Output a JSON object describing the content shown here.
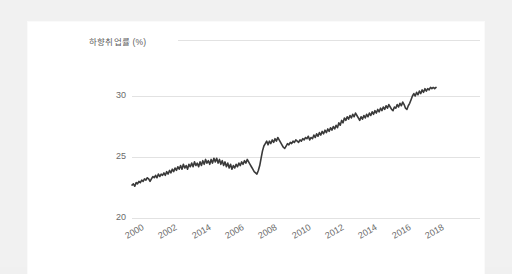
{
  "page": {
    "background_color": "#f1f1f1",
    "card_color": "#ffffff"
  },
  "chart_data": {
    "type": "line",
    "title": "",
    "subtitle": "",
    "xlabel": "",
    "ylabel": "하향취업률 (%)",
    "ylabel_position": "top-left",
    "grid": "horizontal",
    "legend": "none",
    "line_color": "#3a3a3a",
    "line_width": 1.6,
    "axis_tick_color": "#6a6a6a",
    "gridline_color": "#e2e2e2",
    "ylim": [
      20,
      31.5
    ],
    "yticks": [
      20,
      25,
      30
    ],
    "ytick_labels": [
      "20",
      "25",
      "30"
    ],
    "xlim": [
      2000,
      2019.2
    ],
    "xtick_values": [
      2000,
      2002,
      2004,
      2006,
      2008,
      2010,
      2012,
      2014,
      2016,
      2018
    ],
    "xtick_labels": [
      "2000",
      "2002",
      "2014",
      "2006",
      "2008",
      "2010",
      "2012",
      "2014",
      "2016",
      "2018"
    ],
    "xtick_note": "third tick label is printed as 2014 in the source image though its position corresponds to 2004",
    "series": [
      {
        "name": "하향취업률",
        "x_start": 2000.0,
        "x_step": 0.0833,
        "values": [
          22.7,
          22.8,
          22.6,
          22.9,
          22.8,
          23.0,
          22.9,
          23.1,
          23.0,
          23.2,
          23.1,
          23.3,
          23.2,
          23.0,
          23.2,
          23.4,
          23.3,
          23.5,
          23.3,
          23.6,
          23.4,
          23.6,
          23.5,
          23.7,
          23.5,
          23.8,
          23.6,
          23.9,
          23.7,
          24.0,
          23.8,
          24.1,
          23.9,
          24.2,
          24.0,
          24.3,
          24.0,
          24.4,
          24.1,
          24.3,
          24.0,
          24.4,
          24.2,
          24.5,
          24.2,
          24.6,
          24.3,
          24.5,
          24.2,
          24.6,
          24.3,
          24.7,
          24.4,
          24.8,
          24.5,
          24.7,
          24.4,
          24.8,
          24.5,
          24.9,
          24.6,
          24.9,
          24.5,
          24.8,
          24.4,
          24.7,
          24.3,
          24.6,
          24.2,
          24.5,
          24.1,
          24.4,
          24.0,
          24.3,
          24.1,
          24.4,
          24.2,
          24.5,
          24.3,
          24.6,
          24.4,
          24.7,
          24.5,
          24.8,
          24.6,
          24.4,
          24.2,
          24.0,
          23.8,
          23.7,
          23.6,
          23.9,
          24.3,
          24.9,
          25.5,
          25.9,
          26.1,
          26.3,
          26.0,
          26.3,
          26.1,
          26.4,
          26.2,
          26.5,
          26.3,
          26.6,
          26.4,
          26.2,
          26.0,
          25.8,
          25.7,
          25.9,
          26.1,
          26.0,
          26.2,
          26.1,
          26.3,
          26.2,
          26.4,
          26.3,
          26.2,
          26.4,
          26.3,
          26.5,
          26.4,
          26.6,
          26.5,
          26.7,
          26.4,
          26.6,
          26.5,
          26.8,
          26.6,
          26.9,
          26.7,
          27.0,
          26.8,
          27.1,
          26.9,
          27.2,
          27.0,
          27.3,
          27.1,
          27.4,
          27.2,
          27.5,
          27.3,
          27.6,
          27.4,
          27.8,
          27.6,
          28.0,
          27.8,
          28.2,
          28.0,
          28.3,
          28.1,
          28.4,
          28.2,
          28.5,
          28.3,
          28.6,
          28.4,
          28.2,
          28.0,
          28.3,
          28.1,
          28.4,
          28.2,
          28.5,
          28.3,
          28.6,
          28.4,
          28.7,
          28.5,
          28.8,
          28.6,
          28.9,
          28.7,
          29.0,
          28.8,
          29.1,
          28.9,
          29.2,
          29.0,
          29.3,
          29.1,
          28.9,
          28.8,
          29.1,
          29.0,
          29.3,
          29.1,
          29.4,
          29.2,
          29.5,
          29.3,
          29.0,
          28.9,
          29.2,
          29.4,
          29.7,
          30.0,
          30.2,
          30.0,
          30.3,
          30.1,
          30.4,
          30.2,
          30.5,
          30.3,
          30.6,
          30.4,
          30.6,
          30.5,
          30.7,
          30.6,
          30.7,
          30.6,
          30.7
        ]
      }
    ]
  }
}
